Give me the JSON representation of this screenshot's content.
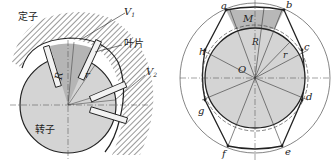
{
  "left_figure": {
    "stator_label": "定子",
    "vane_label": "叶片",
    "rotor_label": "转子",
    "v1_label": "V",
    "v1_sub": "1",
    "v2_label": "V",
    "v2_sub": "2",
    "big_radius_label": "R",
    "small_radius_label": "r"
  },
  "right_figure": {
    "points": [
      "a",
      "b",
      "c",
      "d",
      "e",
      "f",
      "g",
      "h"
    ],
    "labels": {
      "a": "a",
      "b": "b",
      "c": "c",
      "d": "d",
      "e": "e",
      "f": "f",
      "g": "g",
      "h": "h",
      "M": "M",
      "O": "O",
      "R": "R",
      "r": "r"
    }
  },
  "colors": {
    "rotor_fill": "#d4d4d4",
    "sector_fill": "#b8b8b8",
    "line": "#222222",
    "hatch": "#333333"
  }
}
